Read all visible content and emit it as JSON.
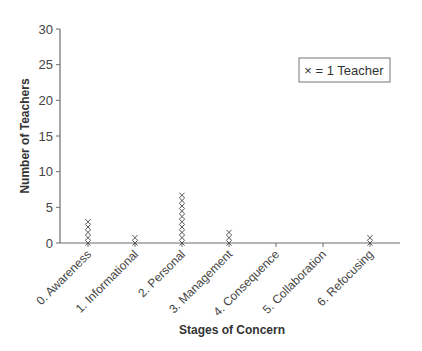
{
  "chart_data": {
    "type": "scatter",
    "subtype": "dot-plot",
    "title": "",
    "xlabel": "Stages of Concern",
    "ylabel": "Number of Teachers",
    "categories": [
      "0. Awareness",
      "1. Informational",
      "2. Personal",
      "3. Management",
      "4. Consequence",
      "5. Collaboration",
      "6. Refocusing"
    ],
    "values": [
      5,
      2,
      10,
      3,
      0,
      0,
      2
    ],
    "ylim": [
      0,
      30
    ],
    "yticks": [
      0,
      5,
      10,
      15,
      20,
      25,
      30
    ],
    "grid": false,
    "marker": "×",
    "legend": {
      "text": "× = 1 Teacher",
      "position": "top-right"
    }
  },
  "colors": {
    "axis": "#6b6b6b",
    "marker": "#555555",
    "text": "#333333"
  }
}
